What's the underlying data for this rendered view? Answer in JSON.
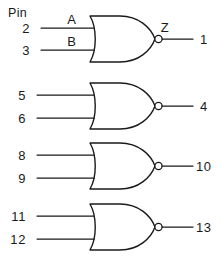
{
  "diagram": {
    "header_label": "Pin",
    "line_color": "#1a1a1a",
    "background": "#ffffff",
    "gate_type": "NOR"
  },
  "gates": [
    {
      "name": "gate-1",
      "inputs": [
        {
          "pin": "2",
          "signal": "A"
        },
        {
          "pin": "3",
          "signal": "B"
        }
      ],
      "output": {
        "pin": "1",
        "signal": "Z"
      }
    },
    {
      "name": "gate-2",
      "inputs": [
        {
          "pin": "5",
          "signal": ""
        },
        {
          "pin": "6",
          "signal": ""
        }
      ],
      "output": {
        "pin": "4",
        "signal": ""
      }
    },
    {
      "name": "gate-3",
      "inputs": [
        {
          "pin": "8",
          "signal": ""
        },
        {
          "pin": "9",
          "signal": ""
        }
      ],
      "output": {
        "pin": "10",
        "signal": ""
      }
    },
    {
      "name": "gate-4",
      "inputs": [
        {
          "pin": "11",
          "signal": ""
        },
        {
          "pin": "12",
          "signal": ""
        }
      ],
      "output": {
        "pin": "13",
        "signal": ""
      }
    }
  ]
}
